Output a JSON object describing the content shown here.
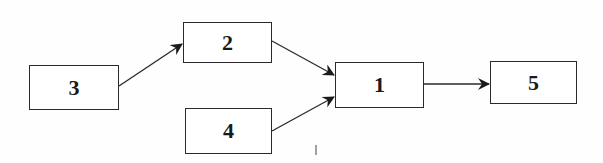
{
  "diagram": {
    "type": "flow",
    "nodes": [
      {
        "id": "3",
        "label": "3",
        "x": 29,
        "y": 65,
        "w": 90,
        "h": 45
      },
      {
        "id": "2",
        "label": "2",
        "x": 183,
        "y": 22,
        "w": 89,
        "h": 41
      },
      {
        "id": "4",
        "label": "4",
        "x": 185,
        "y": 108,
        "w": 87,
        "h": 46
      },
      {
        "id": "1",
        "label": "1",
        "x": 335,
        "y": 62,
        "w": 89,
        "h": 46
      },
      {
        "id": "5",
        "label": "5",
        "x": 490,
        "y": 61,
        "w": 87,
        "h": 43
      }
    ],
    "edges": [
      {
        "from": "3",
        "to": "2"
      },
      {
        "from": "2",
        "to": "1"
      },
      {
        "from": "4",
        "to": "1"
      },
      {
        "from": "1",
        "to": "5"
      }
    ],
    "colors": {
      "line": "#2a2a2a",
      "background": "#fefefe"
    }
  }
}
